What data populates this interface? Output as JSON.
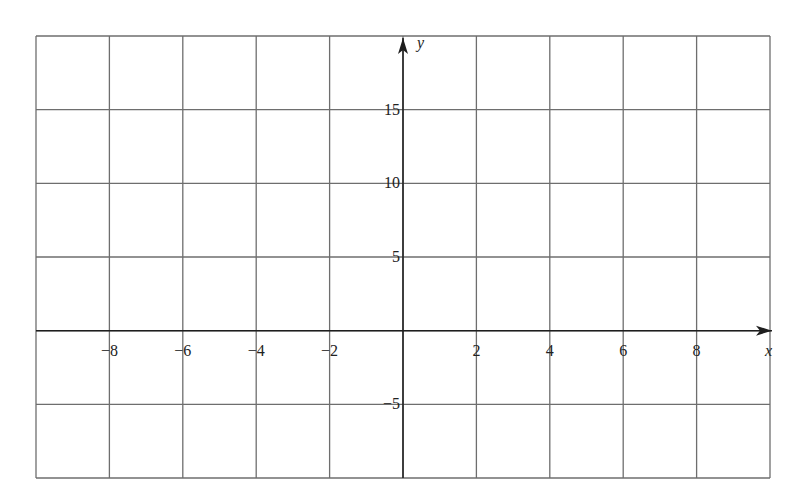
{
  "chart_data": {
    "type": "line",
    "title": "",
    "xlabel": "x",
    "ylabel": "y",
    "xlim": [
      -10,
      10
    ],
    "ylim": [
      -10,
      20
    ],
    "grid": true,
    "grid_x_step": 2,
    "grid_y_step": 5,
    "x_ticks": [
      -8,
      -6,
      -4,
      -2,
      2,
      4,
      6,
      8
    ],
    "x_tick_labels": [
      "−8",
      "−6",
      "−4",
      "−2",
      "2",
      "4",
      "6",
      "8"
    ],
    "y_ticks": [
      15,
      10,
      5,
      -5
    ],
    "y_tick_labels": [
      "15",
      "10",
      "5",
      "−5"
    ],
    "series": [],
    "colors": {
      "grid": "#6e6e6e",
      "axis": "#1e1e1e",
      "text": "#222222",
      "background": "#ffffff"
    }
  }
}
